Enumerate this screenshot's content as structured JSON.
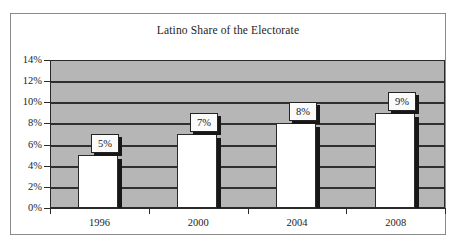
{
  "chart_data": {
    "type": "bar",
    "title": "Latino Share of the Electorate",
    "xlabel": "",
    "ylabel": "",
    "categories": [
      "1996",
      "2000",
      "2004",
      "2008"
    ],
    "values": [
      5,
      7,
      8,
      9
    ],
    "data_labels": [
      "5%",
      "7%",
      "8%",
      "9%"
    ],
    "ylim": [
      0,
      14
    ],
    "ytick_values": [
      0,
      2,
      4,
      6,
      8,
      10,
      12,
      14
    ],
    "ytick_labels": [
      "0%",
      "2%",
      "4%",
      "6%",
      "8%",
      "10%",
      "12%",
      "14%"
    ],
    "grid": true,
    "legend": false,
    "legend_position": "none",
    "colors": {
      "plot_background": "#b6b6b6",
      "bar_fill": "#ffffff",
      "bar_outline": "#2a2a2a",
      "bar_shadow": "#171717",
      "gridline": "#303030",
      "axis": "#2a2a2a",
      "frame_border": "#8a8a8a",
      "page_background": "#ffffff",
      "text": "#1d1d1d",
      "label_box_fill": "#fbfbfb"
    }
  }
}
